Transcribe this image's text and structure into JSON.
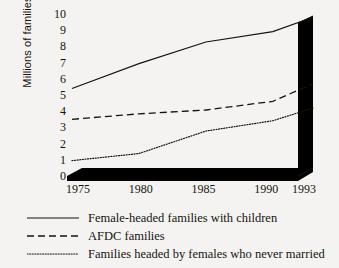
{
  "chart_data": {
    "type": "line",
    "title": "",
    "xlabel": "",
    "ylabel": "Millions of families",
    "x": [
      1975,
      1980,
      1985,
      1990,
      1993
    ],
    "xtick_labels": [
      "1975",
      "1980",
      "1985",
      "1990",
      "1993"
    ],
    "ytick_labels": [
      "10",
      "9",
      "8",
      "7",
      "6",
      "5",
      "4",
      "3",
      "2",
      "1",
      "0"
    ],
    "ylim": [
      0,
      10
    ],
    "xlim": [
      1975,
      1993
    ],
    "grid": false,
    "legend_position": "below",
    "series": [
      {
        "name": "Female-headed families with children",
        "style": "solid",
        "values": [
          5.4,
          6.8,
          8.0,
          8.5,
          9.3
        ]
      },
      {
        "name": "AFDC families",
        "style": "dashed",
        "values": [
          3.5,
          3.7,
          3.8,
          4.2,
          5.2
        ]
      },
      {
        "name": "Families headed by females who never married",
        "style": "dotted",
        "values": [
          0.95,
          1.25,
          2.5,
          3.0,
          3.7
        ]
      }
    ]
  },
  "legend": {
    "items": [
      {
        "label": "Female-headed families with children",
        "sample": "solid-line-sample"
      },
      {
        "label": "AFDC families",
        "sample": "dashed-line-sample"
      },
      {
        "label": "Families headed by females who never married",
        "sample": "dotted-line-sample"
      }
    ]
  },
  "colors": {
    "background": "#f4f3f1",
    "ink": "#15130f",
    "wall": "#000000"
  }
}
